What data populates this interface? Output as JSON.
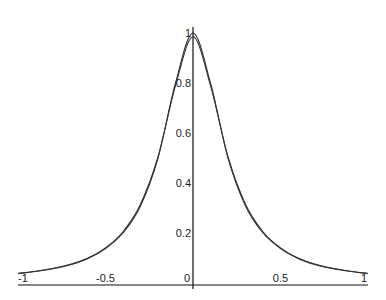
{
  "chart_data": {
    "type": "line",
    "title": "",
    "xlabel": "",
    "ylabel": "",
    "xlim": [
      -1,
      1
    ],
    "ylim": [
      0,
      1
    ],
    "grid": false,
    "legend": null,
    "x_ticks": [
      {
        "value": -1,
        "label": "-1"
      },
      {
        "value": -0.5,
        "label": "-0.5"
      },
      {
        "value": 0,
        "label": "0"
      },
      {
        "value": 0.5,
        "label": "0.5"
      },
      {
        "value": 1,
        "label": "1"
      }
    ],
    "y_ticks": [
      {
        "value": 0.2,
        "label": "0.2"
      },
      {
        "value": 0.4,
        "label": "0.4"
      },
      {
        "value": 0.6,
        "label": "0.6"
      },
      {
        "value": 0.8,
        "label": "0.8"
      },
      {
        "value": 1,
        "label": "1"
      }
    ],
    "x": [
      -1,
      -0.9,
      -0.8,
      -0.7,
      -0.6,
      -0.5,
      -0.4,
      -0.3,
      -0.2,
      -0.1,
      0,
      0.1,
      0.2,
      0.3,
      0.4,
      0.5,
      0.6,
      0.7,
      0.8,
      0.9,
      1
    ],
    "series": [
      {
        "name": "f(x) = 1/(1+25x^2)",
        "values": [
          0.038,
          0.047,
          0.059,
          0.075,
          0.1,
          0.138,
          0.2,
          0.308,
          0.5,
          0.8,
          1.0,
          0.8,
          0.5,
          0.308,
          0.2,
          0.138,
          0.1,
          0.075,
          0.059,
          0.047,
          0.038
        ]
      },
      {
        "name": "approximation",
        "values": [
          0.038,
          0.046,
          0.057,
          0.073,
          0.098,
          0.14,
          0.205,
          0.315,
          0.505,
          0.79,
          0.985,
          0.79,
          0.505,
          0.315,
          0.205,
          0.14,
          0.098,
          0.073,
          0.057,
          0.046,
          0.038
        ]
      }
    ]
  }
}
